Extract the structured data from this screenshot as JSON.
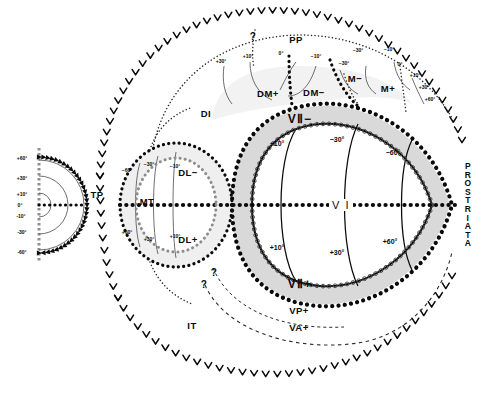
{
  "figure": {
    "type": "neuroanatomical-visual-field-map",
    "background_color": "#ffffff",
    "ink_color": "#0a0a0a",
    "band_fill": "#d9d9d9",
    "panel_fill": "#efefef"
  },
  "inset": {
    "name": "hemifield-polar-inset",
    "description": "semicircular visual hemifield with eccentricity arcs",
    "labels": [
      "+60°",
      "+30°",
      "+10°",
      "0°",
      "-10°",
      "-30°",
      "-60°"
    ],
    "arc_count": 3
  },
  "areas": [
    {
      "id": "PP",
      "label": "PP",
      "x": 296,
      "y": 39,
      "class": "area"
    },
    {
      "id": "DI",
      "label": "DI",
      "x": 206,
      "y": 113,
      "class": "area"
    },
    {
      "id": "TP",
      "label": "TP",
      "x": 97,
      "y": 194,
      "class": "area"
    },
    {
      "id": "MT",
      "label": "MT",
      "x": 147,
      "y": 201,
      "class": "area"
    },
    {
      "id": "IT",
      "label": "IT",
      "x": 192,
      "y": 325,
      "class": "area"
    },
    {
      "id": "DMplus",
      "label": "DM+",
      "x": 268,
      "y": 93,
      "class": "area"
    },
    {
      "id": "DMminus",
      "label": "DM−",
      "x": 314,
      "y": 92,
      "class": "area"
    },
    {
      "id": "Mminus",
      "label": "M−",
      "x": 355,
      "y": 78,
      "class": "area"
    },
    {
      "id": "Mplus",
      "label": "M+",
      "x": 388,
      "y": 88,
      "class": "area"
    },
    {
      "id": "DLminus",
      "label": "DL−",
      "x": 188,
      "y": 172,
      "class": "area"
    },
    {
      "id": "DLplus",
      "label": "DL+",
      "x": 188,
      "y": 239,
      "class": "area"
    },
    {
      "id": "VPplus",
      "label": "VP+",
      "x": 299,
      "y": 310,
      "class": "area"
    },
    {
      "id": "VAplus",
      "label": "VA+",
      "x": 299,
      "y": 327,
      "class": "area"
    },
    {
      "id": "V2minus",
      "label": "VⅡ−",
      "x": 300,
      "y": 119,
      "class": "area-big"
    },
    {
      "id": "V2plus",
      "label": "VⅡ+",
      "x": 300,
      "y": 284,
      "class": "area-big"
    }
  ],
  "v1_label": "V I",
  "prostriata": {
    "label": "PROSTRIATA",
    "letters": [
      "P",
      "R",
      "O",
      "S",
      "T",
      "R",
      "I",
      "A",
      "T",
      "A"
    ]
  },
  "v1_eccentricity_upper": [
    {
      "text": "−10°",
      "x": 277,
      "y": 143
    },
    {
      "text": "−30°",
      "x": 337,
      "y": 139
    },
    {
      "text": "−60°",
      "x": 393,
      "y": 152
    }
  ],
  "v1_eccentricity_lower": [
    {
      "text": "+10°",
      "x": 277,
      "y": 247
    },
    {
      "text": "+30°",
      "x": 337,
      "y": 252
    },
    {
      "text": "+60°",
      "x": 390,
      "y": 241
    }
  ],
  "dm_ticks": [
    {
      "text": "+30°",
      "x": 221,
      "y": 61
    },
    {
      "text": "+10°",
      "x": 248,
      "y": 56
    },
    {
      "text": "0°",
      "x": 281,
      "y": 53
    },
    {
      "text": "−10°",
      "x": 316,
      "y": 56
    },
    {
      "text": "−30°",
      "x": 344,
      "y": 63
    }
  ],
  "m_ticks": [
    {
      "text": "−30°",
      "x": 358,
      "y": 50
    },
    {
      "text": "−10°",
      "x": 389,
      "y": 49
    },
    {
      "text": "0°",
      "x": 400,
      "y": 64
    },
    {
      "text": "+10°",
      "x": 415,
      "y": 75
    },
    {
      "text": "+30°",
      "x": 424,
      "y": 87
    },
    {
      "text": "+60°",
      "x": 430,
      "y": 99
    }
  ],
  "mt_ticks_upper": [
    {
      "text": "−60°",
      "x": 127,
      "y": 170
    },
    {
      "text": "−30°",
      "x": 149,
      "y": 164
    },
    {
      "text": "−10°",
      "x": 175,
      "y": 166
    }
  ],
  "mt_ticks_lower": [
    {
      "text": "+60°",
      "x": 127,
      "y": 232
    },
    {
      "text": "+30°",
      "x": 149,
      "y": 239
    },
    {
      "text": "+10°",
      "x": 175,
      "y": 236
    }
  ],
  "question_marks": [
    {
      "x": 253,
      "y": 36
    },
    {
      "x": 214,
      "y": 272
    },
    {
      "x": 204,
      "y": 284
    }
  ]
}
